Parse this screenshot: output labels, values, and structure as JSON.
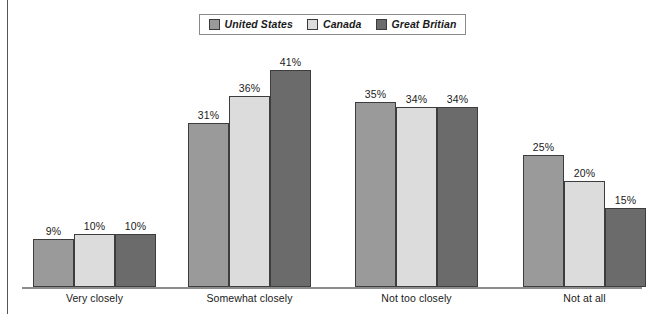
{
  "legend": {
    "items": [
      {
        "label": "United States",
        "color": "#9a9a9a",
        "icon": "legend-swatch-icon"
      },
      {
        "label": "Canada",
        "color": "#dcdcdc",
        "icon": "legend-swatch-icon"
      },
      {
        "label": "Great Britian",
        "color": "#6b6b6b",
        "icon": "legend-swatch-icon"
      }
    ]
  },
  "chart_data": {
    "type": "bar",
    "title": "",
    "subtitle": "",
    "xlabel": "",
    "ylabel": "",
    "ylim": [
      0,
      45
    ],
    "grid": false,
    "legend_position": "top-center",
    "categories": [
      "Very closely",
      "Somewhat closely",
      "Not too closely",
      "Not at all"
    ],
    "series": [
      {
        "name": "United States",
        "color": "#9a9a9a",
        "values": [
          9,
          31,
          35,
          25
        ],
        "labels": [
          "9%",
          "31%",
          "35%",
          "25%"
        ]
      },
      {
        "name": "Canada",
        "color": "#dcdcdc",
        "values": [
          10,
          36,
          34,
          20
        ],
        "labels": [
          "10%",
          "36%",
          "34%",
          "20%"
        ]
      },
      {
        "name": "Great Britian",
        "color": "#6b6b6b",
        "values": [
          10,
          41,
          34,
          15
        ],
        "labels": [
          "10%",
          "41%",
          "34%",
          "15%"
        ]
      }
    ]
  },
  "axis": {
    "baseline_color": "#8d8d8d",
    "border_color": "#555555"
  }
}
